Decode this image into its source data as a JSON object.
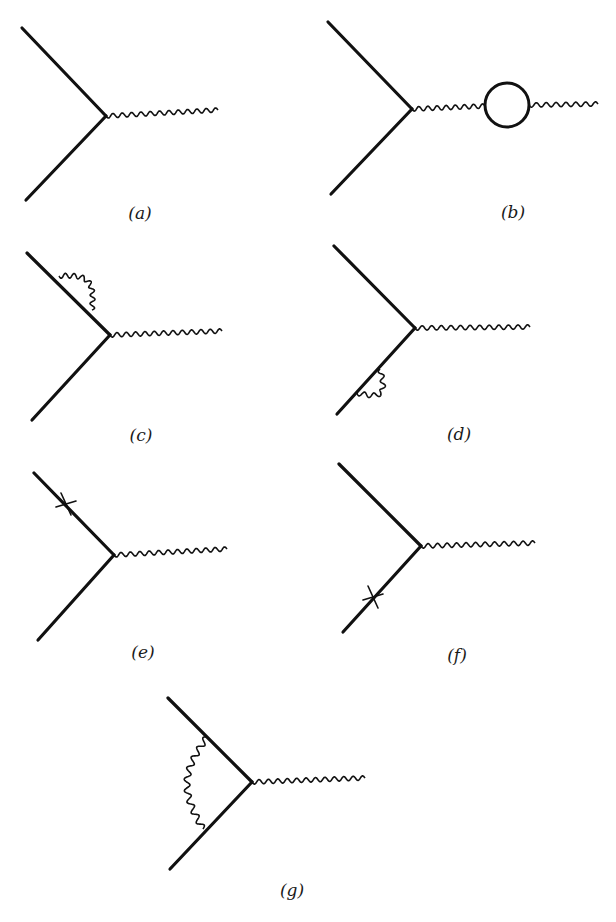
{
  "figure": {
    "colors": {
      "ink": "#111111",
      "background": "#ffffff"
    },
    "diagrams": [
      {
        "id": "a",
        "label": "(a)",
        "kind": "tree-vertex",
        "fermion_in": [
          [
            22,
            28
          ],
          [
            106,
            116
          ]
        ],
        "fermion_out": [
          [
            106,
            116
          ],
          [
            26,
            200
          ]
        ],
        "photon": [
          [
            106,
            116
          ],
          [
            218,
            110
          ]
        ],
        "label_pos": [
          140,
          213
        ]
      },
      {
        "id": "b",
        "label": "(b)",
        "kind": "vacuum-polarization",
        "fermion_in": [
          [
            328,
            22
          ],
          [
            412,
            109
          ]
        ],
        "fermion_out": [
          [
            412,
            109
          ],
          [
            331,
            194
          ]
        ],
        "photon": [
          [
            412,
            109
          ],
          [
            485,
            106
          ]
        ],
        "bubble": {
          "cx": 507,
          "cy": 105,
          "r": 22
        },
        "photon2": [
          [
            529,
            105
          ],
          [
            598,
            104
          ]
        ],
        "label_pos": [
          513,
          212
        ]
      },
      {
        "id": "c",
        "label": "(c)",
        "kind": "self-energy-incoming",
        "fermion_in": [
          [
            27,
            253
          ],
          [
            110,
            335
          ]
        ],
        "fermion_out": [
          [
            110,
            335
          ],
          [
            32,
            420
          ]
        ],
        "photon": [
          [
            110,
            335
          ],
          [
            222,
            331
          ]
        ],
        "self_energy_loop": [
          [
            59,
            276
          ],
          [
            92,
            310
          ]
        ],
        "label_pos": [
          141,
          435
        ]
      },
      {
        "id": "d",
        "label": "(d)",
        "kind": "self-energy-outgoing",
        "fermion_in": [
          [
            334,
            246
          ],
          [
            415,
            328
          ]
        ],
        "fermion_out": [
          [
            415,
            328
          ],
          [
            337,
            414
          ]
        ],
        "photon": [
          [
            415,
            328
          ],
          [
            530,
            327
          ]
        ],
        "self_energy_loop": [
          [
            357,
            393
          ],
          [
            380,
            369
          ]
        ],
        "label_pos": [
          459,
          434
        ]
      },
      {
        "id": "e",
        "label": "(e)",
        "kind": "counterterm-incoming",
        "fermion_in": [
          [
            34,
            473
          ],
          [
            114,
            555
          ]
        ],
        "fermion_out": [
          [
            114,
            555
          ],
          [
            38,
            640
          ]
        ],
        "photon": [
          [
            114,
            555
          ],
          [
            227,
            549
          ]
        ],
        "cross": [
          66,
          504
        ],
        "label_pos": [
          143,
          652
        ]
      },
      {
        "id": "f",
        "label": "(f)",
        "kind": "counterterm-outgoing",
        "fermion_in": [
          [
            339,
            464
          ],
          [
            421,
            546
          ]
        ],
        "fermion_out": [
          [
            421,
            546
          ],
          [
            343,
            632
          ]
        ],
        "photon": [
          [
            421,
            546
          ],
          [
            535,
            543
          ]
        ],
        "cross": [
          373,
          597
        ],
        "label_pos": [
          457,
          655
        ]
      },
      {
        "id": "g",
        "label": "(g)",
        "kind": "vertex-correction",
        "fermion_in": [
          [
            168,
            698
          ],
          [
            252,
            782
          ]
        ],
        "fermion_out": [
          [
            252,
            782
          ],
          [
            170,
            869
          ]
        ],
        "photon": [
          [
            252,
            782
          ],
          [
            365,
            778
          ]
        ],
        "internal_photon": [
          [
            207,
            737
          ],
          [
            203,
            829
          ]
        ],
        "label_pos": [
          292,
          890
        ]
      }
    ]
  }
}
